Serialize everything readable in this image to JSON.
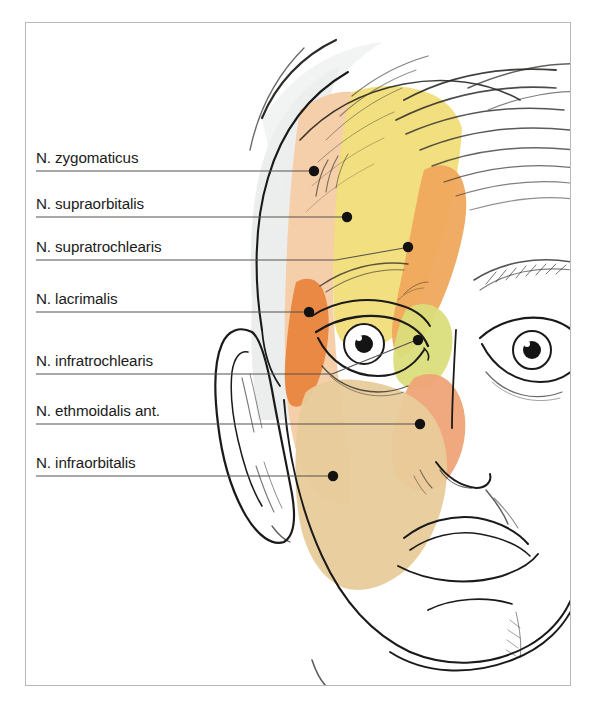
{
  "figure": {
    "frame": {
      "x": 25,
      "y": 22,
      "width": 546,
      "height": 664,
      "border_color": "#b8b8b8"
    },
    "background_color": "#ffffff",
    "line_art_color": "#1a1a1a"
  },
  "labels": [
    {
      "id": "n-zygomaticus",
      "text": "N. zygomaticus",
      "text_x": 36,
      "text_y": 161,
      "line_y": 171,
      "line_x1": 36,
      "line_x2": 312,
      "dot_x": 314,
      "dot_y": 171,
      "region_color": "#F5CDA7",
      "region_name": "lateral-forehead-peach"
    },
    {
      "id": "n-supraorbitalis",
      "text": "N. supraorbitalis",
      "text_x": 36,
      "text_y": 207,
      "line_y": 217,
      "line_x1": 36,
      "line_x2": 345,
      "dot_x": 347,
      "dot_y": 217,
      "region_color": "#F2DE7C",
      "region_name": "central-forehead-yellow"
    },
    {
      "id": "n-supratrochlearis",
      "text": "N. supratrochlearis",
      "text_x": 36,
      "text_y": 250,
      "line_y": 260,
      "line_x1": 36,
      "line_x2": 406,
      "dot_x": 408,
      "dot_y": 247,
      "region_color": "#EFA85C",
      "region_name": "medial-forehead-orange"
    },
    {
      "id": "n-lacrimalis",
      "text": "N. lacrimalis",
      "text_x": 36,
      "text_y": 302,
      "line_y": 312,
      "line_x1": 36,
      "line_x2": 307,
      "dot_x": 309,
      "dot_y": 312,
      "region_color": "#E8833C",
      "region_name": "lateral-orbit-dark-orange"
    },
    {
      "id": "n-infratrochlearis",
      "text": "N. infratrochlearis",
      "text_x": 36,
      "text_y": 364,
      "line_y": 374,
      "line_x1": 36,
      "line_x2": 332,
      "dot_x": 418,
      "dot_y": 340,
      "region_color": "#DBDE7A",
      "region_name": "medial-canthus-yellow-green"
    },
    {
      "id": "n-ethmoidalis-ant",
      "text": "N. ethmoidalis ant.",
      "text_x": 36,
      "text_y": 414,
      "line_y": 424,
      "line_x1": 36,
      "line_x2": 418,
      "dot_x": 420,
      "dot_y": 424,
      "region_color": "#EFA377",
      "region_name": "nasal-dorsum-salmon"
    },
    {
      "id": "n-infraorbitalis",
      "text": "N. infraorbitalis",
      "text_x": 36,
      "text_y": 466,
      "line_y": 476,
      "line_x1": 36,
      "line_x2": 331,
      "dot_x": 333,
      "dot_y": 476,
      "region_color": "#E8CB9A",
      "region_name": "cheek-tan"
    }
  ],
  "colors": {
    "zygomaticus": "#F5CDA7",
    "supraorbitalis": "#F2DE7C",
    "supratrochlearis": "#EFA85C",
    "lacrimalis": "#E8833C",
    "infratrochlearis": "#DBDE7A",
    "ethmoidalis": "#EFA377",
    "infraorbitalis": "#E8CB9A",
    "scalp_grey": "#E2E4E3",
    "leader_line": "#55534f",
    "dot": "#121212",
    "frame_border": "#b8b8b8",
    "hair_stroke": "#2b2b28"
  }
}
